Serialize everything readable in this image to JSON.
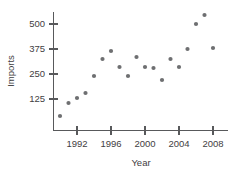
{
  "chart_data": {
    "type": "scatter",
    "title": "",
    "xlabel": "Year",
    "ylabel": "Imports",
    "xlim": [
      1989.3,
      2009.2
    ],
    "ylim": [
      0,
      560
    ],
    "grid": false,
    "legend": null,
    "xticks": [
      1992,
      1996,
      2000,
      2004,
      2008
    ],
    "xtick_labels": [
      "1992",
      "1996",
      "2000",
      "2004",
      "2008"
    ],
    "yticks": [
      125,
      250,
      375,
      500
    ],
    "ytick_labels": [
      "125",
      "250",
      "375",
      "500"
    ],
    "marker": "filled-circle",
    "marker_color": "#6e6f71",
    "points": [
      {
        "x": 1990,
        "y": 40
      },
      {
        "x": 1991,
        "y": 105
      },
      {
        "x": 1992,
        "y": 130
      },
      {
        "x": 1993,
        "y": 155
      },
      {
        "x": 1994,
        "y": 240
      },
      {
        "x": 1995,
        "y": 325
      },
      {
        "x": 1996,
        "y": 365
      },
      {
        "x": 1997,
        "y": 285
      },
      {
        "x": 1998,
        "y": 240
      },
      {
        "x": 1999,
        "y": 335
      },
      {
        "x": 2000,
        "y": 285
      },
      {
        "x": 2001,
        "y": 280
      },
      {
        "x": 2002,
        "y": 220
      },
      {
        "x": 2003,
        "y": 325
      },
      {
        "x": 2004,
        "y": 285
      },
      {
        "x": 2005,
        "y": 375
      },
      {
        "x": 2006,
        "y": 500
      },
      {
        "x": 2007,
        "y": 545
      },
      {
        "x": 2008,
        "y": 380
      }
    ]
  },
  "colors": {
    "axis": "#58595b",
    "text": "#3f4042",
    "marker": "#6e6f71",
    "background": "#ffffff"
  }
}
